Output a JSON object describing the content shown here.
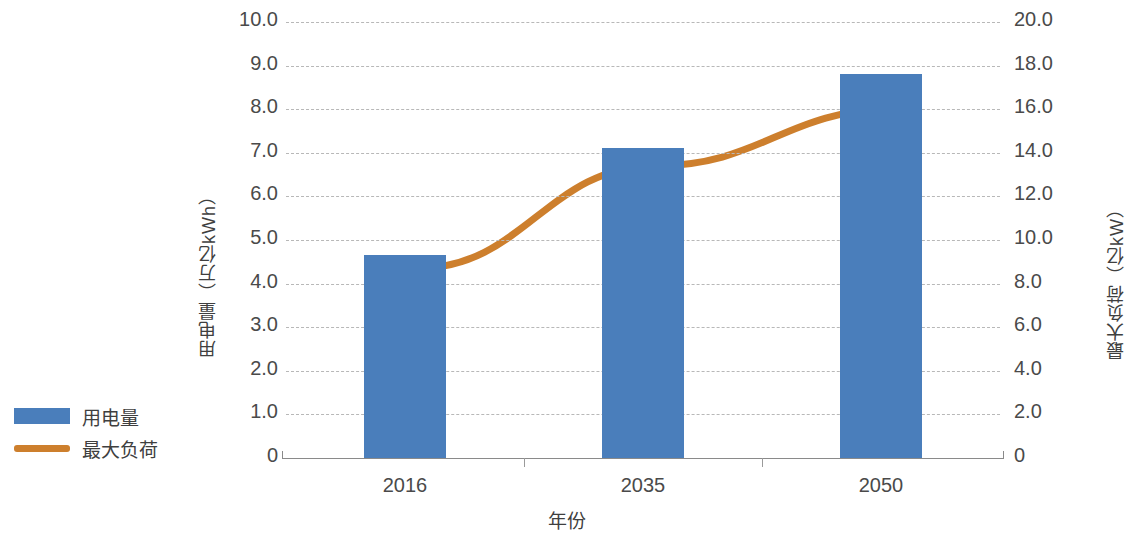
{
  "chart_data": {
    "type": "bar",
    "title": "",
    "subtitle": "",
    "xlabel": "年份",
    "ylabel": "用电量（万亿kWh）",
    "y2label": "最大负荷（亿kW）",
    "categories": [
      "2016",
      "2035",
      "2050"
    ],
    "grid": true,
    "legend_position": "left",
    "ylim": [
      0,
      10
    ],
    "y2lim": [
      0,
      20
    ],
    "yticks": [
      "0",
      "1.0",
      "2.0",
      "3.0",
      "4.0",
      "5.0",
      "6.0",
      "7.0",
      "8.0",
      "9.0",
      "10.0"
    ],
    "ytick_values": [
      0,
      1,
      2,
      3,
      4,
      5,
      6,
      7,
      8,
      9,
      10
    ],
    "y2ticks": [
      "0",
      "2.0",
      "4.0",
      "6.0",
      "8.0",
      "10.0",
      "12.0",
      "14.0",
      "16.0",
      "18.0",
      "20.0"
    ],
    "y2tick_values": [
      0,
      2,
      4,
      6,
      8,
      10,
      12,
      14,
      16,
      18,
      20
    ],
    "series": [
      {
        "name": "用电量",
        "type": "bar",
        "axis": "left",
        "unit": "万亿kWh",
        "color": "#4a7ebb",
        "values": [
          4.65,
          7.1,
          8.8
        ]
      },
      {
        "name": "最大负荷",
        "type": "line",
        "axis": "right",
        "unit": "亿kW",
        "color": "#cd7f2d",
        "values": [
          8.7,
          13.4,
          16.0
        ]
      }
    ]
  },
  "legend": {
    "items": [
      {
        "label": "用电量",
        "marker": "bar-swatch",
        "color": "#4a7ebb"
      },
      {
        "label": "最大负荷",
        "marker": "line-swatch",
        "color": "#cd7f2d"
      }
    ]
  }
}
